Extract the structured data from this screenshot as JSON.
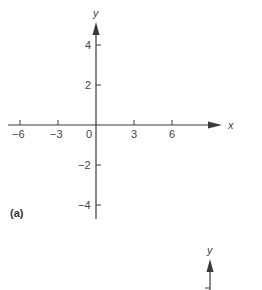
{
  "figure_a": {
    "panel_label": "(a)",
    "x_axis": {
      "label": "x",
      "ticks": [
        {
          "value": -6,
          "label": "−6"
        },
        {
          "value": -3,
          "label": "−3"
        },
        {
          "value": 3,
          "label": "3"
        },
        {
          "value": 6,
          "label": "6"
        }
      ],
      "origin_label": "0"
    },
    "y_axis": {
      "label": "y",
      "ticks": [
        {
          "value": 4,
          "label": "4"
        },
        {
          "value": 2,
          "label": "2"
        },
        {
          "value": -2,
          "label": "−2"
        },
        {
          "value": -4,
          "label": "−4"
        }
      ]
    }
  },
  "figure_b": {
    "y_axis": {
      "label": "y"
    }
  },
  "colors": {
    "axis": "#3a3a3a",
    "background": "#ffffff"
  }
}
